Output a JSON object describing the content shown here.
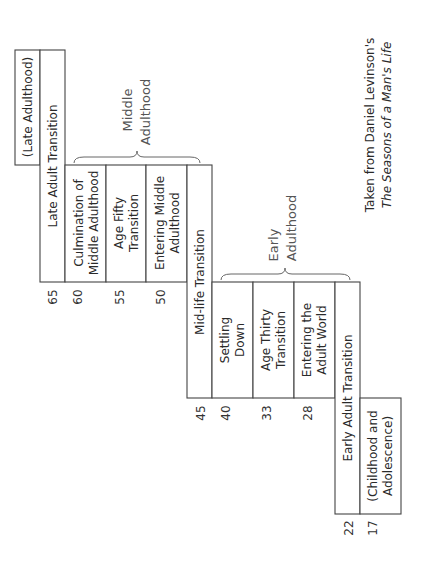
{
  "diagram": {
    "orientation": "rotated-90-ccw",
    "eras": [
      {
        "label": "(Late Adulthood)"
      },
      {
        "label": "Middle Adulthood",
        "line1": "Middle",
        "line2": "Adulthood"
      },
      {
        "label": "Early Adulthood",
        "line1": "Early",
        "line2": "Adulthood"
      },
      {
        "label": "(Childhood and Adolescence)",
        "line1": "(Childhood and",
        "line2": "Adolescence)"
      }
    ],
    "transitions": [
      {
        "label": "Late Adult Transition",
        "start_age": 60,
        "end_age": 65
      },
      {
        "label": "Mid-life Transition",
        "start_age": 40,
        "end_age": 45
      },
      {
        "label": "Early Adult Transition",
        "start_age": 17,
        "end_age": 22
      }
    ],
    "stages": [
      {
        "line1": "Culmination of",
        "line2": "Middle Adulthood",
        "start_age": 55,
        "end_age": 60
      },
      {
        "line1": "Age Fifty",
        "line2": "Transition",
        "start_age": 50,
        "end_age": 55
      },
      {
        "line1": "Entering Middle",
        "line2": "Adulthood",
        "start_age": 45,
        "end_age": 50
      },
      {
        "line1": "Settling",
        "line2": "Down",
        "start_age": 33,
        "end_age": 40
      },
      {
        "line1": "Age Thirty",
        "line2": "Transition",
        "start_age": 28,
        "end_age": 33
      },
      {
        "line1": "Entering the",
        "line2": "Adult World",
        "start_age": 22,
        "end_age": 28
      }
    ],
    "ages": [
      "65",
      "60",
      "55",
      "50",
      "45",
      "40",
      "33",
      "28",
      "22",
      "17"
    ],
    "caption": {
      "line1": "Taken from Daniel Levinson's",
      "line2": "The Seasons of a Man's Life"
    }
  }
}
